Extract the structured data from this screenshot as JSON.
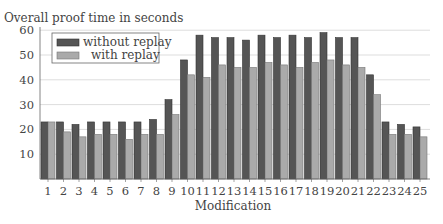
{
  "chart_data": {
    "type": "bar",
    "title": "Overall proof time in seconds",
    "xlabel": "Modification",
    "ylabel": "Overall proof time in seconds",
    "ylim": [
      0,
      60
    ],
    "yticks": [
      10,
      20,
      30,
      40,
      50,
      60
    ],
    "grid": true,
    "legend_position": "upper left",
    "categories": [
      "1",
      "2",
      "3",
      "4",
      "5",
      "6",
      "7",
      "8",
      "9",
      "10",
      "11",
      "12",
      "13",
      "14",
      "15",
      "16",
      "17",
      "18",
      "19",
      "20",
      "21",
      "22",
      "23",
      "24",
      "25"
    ],
    "series": [
      {
        "name": "without replay",
        "color": "#555555",
        "values": [
          23,
          23,
          22,
          23,
          23,
          23,
          23,
          24,
          32,
          48,
          58,
          57,
          57,
          56,
          58,
          57,
          58,
          57,
          59,
          57,
          57,
          42,
          23,
          22,
          21
        ]
      },
      {
        "name": "with replay",
        "color": "#aaaaaa",
        "values": [
          23,
          19,
          17,
          18,
          18,
          16,
          18,
          18,
          26,
          42,
          41,
          46,
          45,
          45,
          47,
          46,
          45,
          47,
          48,
          46,
          45,
          34,
          18,
          18,
          17
        ]
      }
    ]
  },
  "legend": {
    "items": [
      {
        "label": "without replay",
        "color": "#555555"
      },
      {
        "label": "with replay",
        "color": "#aaaaaa"
      }
    ]
  }
}
